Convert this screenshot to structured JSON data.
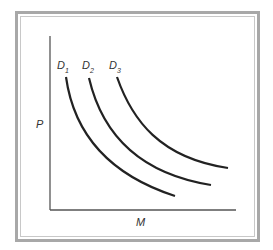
{
  "diagram": {
    "y_axis_label": "P",
    "x_axis_label": "M",
    "curves": [
      {
        "name": "D",
        "subscript": "1",
        "path": "M66,77 C72,120 95,170 175,196"
      },
      {
        "name": "D",
        "subscript": "2",
        "path": "M89,78 C100,125 130,172 211,185"
      },
      {
        "name": "D",
        "subscript": "3",
        "path": "M117,77 C132,120 160,158 228,168"
      }
    ],
    "colors": {
      "frame": "#a8a8a8",
      "line": "#222222",
      "axis": "#555555"
    }
  }
}
